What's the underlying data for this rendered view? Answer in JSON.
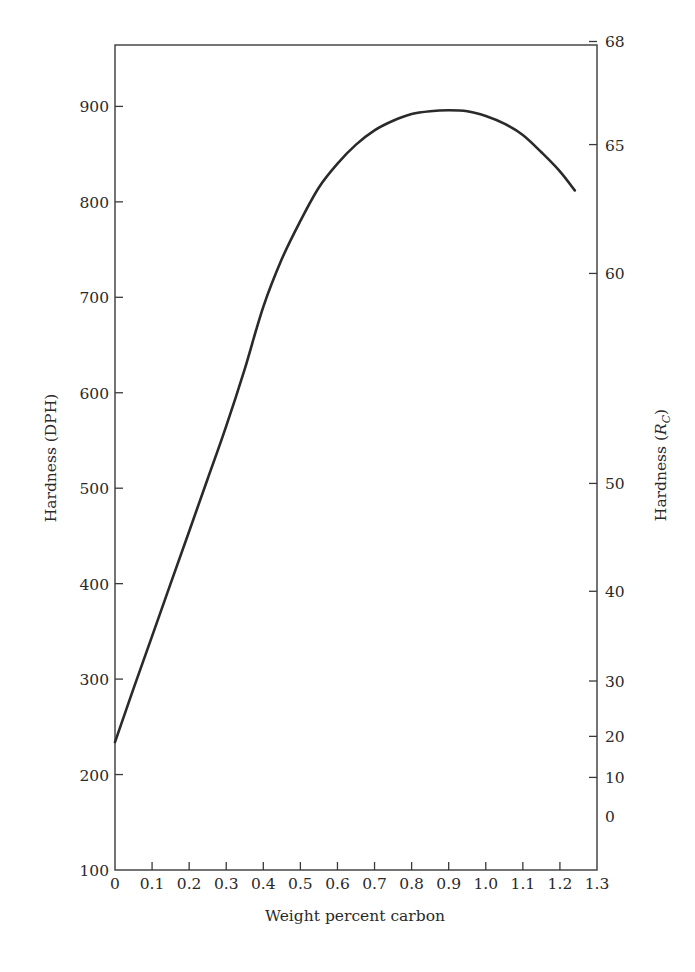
{
  "chart_data": {
    "type": "line",
    "title": "",
    "xlabel": "Weight percent carbon",
    "ylabel": "Hardness (DPH)",
    "ylabel_right": "Hardness (R_C)",
    "ylabel_right_main": "Hardness (",
    "ylabel_right_italic": "R",
    "ylabel_right_sub": "C",
    "ylabel_right_close": ")",
    "xlim": [
      0,
      1.3
    ],
    "ylim": [
      100,
      975
    ],
    "grid": false,
    "legend": "none",
    "x_ticks": [
      "0",
      "0.1",
      "0.2",
      "0.3",
      "0.4",
      "0.5",
      "0.6",
      "0.7",
      "0.8",
      "0.9",
      "1.0",
      "1.1",
      "1.2",
      "1.3"
    ],
    "y_ticks": [
      "100",
      "200",
      "300",
      "400",
      "500",
      "600",
      "700",
      "800",
      "900"
    ],
    "y_right_ticks": [
      {
        "label": "68",
        "dph_equiv": 968
      },
      {
        "label": "65",
        "dph_equiv": 860
      },
      {
        "label": "60",
        "dph_equiv": 725
      },
      {
        "label": "50",
        "dph_equiv": 505
      },
      {
        "label": "40",
        "dph_equiv": 392
      },
      {
        "label": "30",
        "dph_equiv": 298
      },
      {
        "label": "20",
        "dph_equiv": 240
      },
      {
        "label": "10",
        "dph_equiv": 197
      },
      {
        "label": "0",
        "dph_equiv": 157,
        "no_tick": true
      }
    ],
    "series": [
      {
        "name": "Hardness vs carbon",
        "x": [
          0,
          0.05,
          0.1,
          0.15,
          0.2,
          0.25,
          0.3,
          0.35,
          0.4,
          0.45,
          0.5,
          0.55,
          0.6,
          0.65,
          0.7,
          0.75,
          0.8,
          0.85,
          0.9,
          0.95,
          1.0,
          1.05,
          1.1,
          1.15,
          1.2,
          1.24
        ],
        "values": [
          234,
          290,
          345,
          400,
          455,
          510,
          565,
          625,
          690,
          740,
          780,
          815,
          840,
          860,
          875,
          885,
          892,
          895,
          896,
          895,
          890,
          882,
          870,
          852,
          832,
          812
        ],
        "color": "#2a2a2a"
      }
    ]
  }
}
